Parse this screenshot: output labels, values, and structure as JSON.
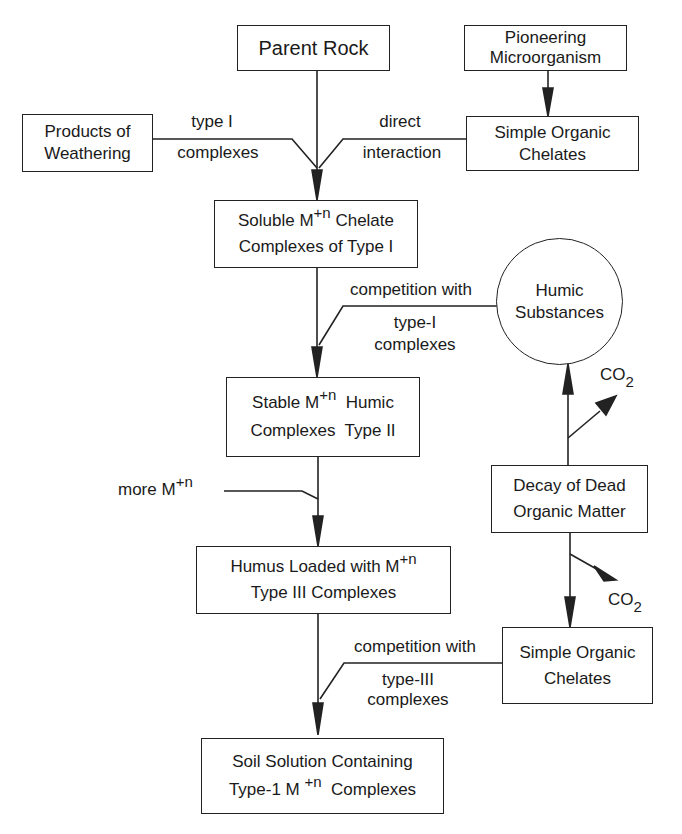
{
  "diagram": {
    "nodes": {
      "parent_rock": {
        "line1": "Parent Rock"
      },
      "pioneering": {
        "line1": "Pioneering",
        "line2": "Microorganism"
      },
      "products_weathering": {
        "line1": "Products of",
        "line2": "Weathering"
      },
      "simple_chelates_top": {
        "line1": "Simple Organic",
        "line2": "Chelates"
      },
      "soluble_type1": {
        "line1_a": "Soluble M",
        "line1_sup": "+n",
        "line1_b": " Chelate",
        "line2": "Complexes of Type I"
      },
      "humic_substances": {
        "line1": "Humic",
        "line2": "Substances"
      },
      "stable_type2": {
        "line1_a": "Stable M",
        "line1_sup": "+n",
        "line1_b": "  Humic",
        "line2": "Complexes  Type II"
      },
      "decay": {
        "line1": "Decay of Dead",
        "line2": "Organic Matter"
      },
      "humus_type3": {
        "line1_a": "Humus Loaded with M",
        "line1_sup": "+n",
        "line2": "Type III Complexes"
      },
      "simple_chelates_bottom": {
        "line1": "Simple Organic",
        "line2": "Chelates"
      },
      "soil_solution": {
        "line1": "Soil Solution Containing",
        "line2_a": "Type-1 M ",
        "line2_sup": "+n",
        "line2_b": "  Complexes"
      }
    },
    "edge_labels": {
      "type1_top": "type I",
      "type1_bottom": "complexes",
      "direct_top": "direct",
      "direct_bottom": "interaction",
      "comp1_top": "competition with",
      "comp1_bottom1": "type-I",
      "comp1_bottom2": "complexes",
      "more_m": "more M",
      "more_m_sup": "+n",
      "co2_upper": "CO",
      "co2_upper_sub": "2",
      "co2_lower": "CO",
      "co2_lower_sub": "2",
      "comp2_top": "competition with",
      "comp2_bottom1": "type-III",
      "comp2_bottom2": "complexes"
    },
    "colors": {
      "line": "#222222",
      "background": "#ffffff"
    }
  }
}
